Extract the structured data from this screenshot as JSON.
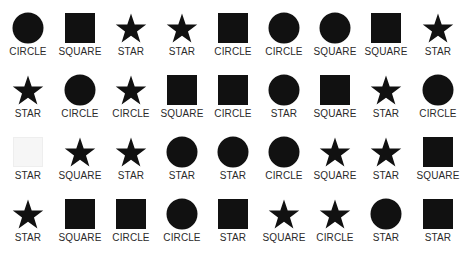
{
  "colors": {
    "fill": "#111111",
    "faint": "#f6f6f6",
    "faint_stroke": "#eeeeee",
    "label": "#2a2a2a"
  },
  "grid": {
    "rows": [
      [
        {
          "shape": "circle",
          "label": "CIRCLE"
        },
        {
          "shape": "square",
          "label": "SQUARE"
        },
        {
          "shape": "star",
          "label": "STAR"
        },
        {
          "shape": "star",
          "label": "STAR"
        },
        {
          "shape": "square",
          "label": "CIRCLE"
        },
        {
          "shape": "circle",
          "label": "CIRCLE"
        },
        {
          "shape": "circle",
          "label": "SQUARE"
        },
        {
          "shape": "square",
          "label": "SQUARE"
        },
        {
          "shape": "star",
          "label": "STAR"
        }
      ],
      [
        {
          "shape": "star",
          "label": "STAR"
        },
        {
          "shape": "circle",
          "label": "CIRCLE"
        },
        {
          "shape": "star",
          "label": "CIRCLE"
        },
        {
          "shape": "square",
          "label": "SQUARE"
        },
        {
          "shape": "square",
          "label": "CIRCLE"
        },
        {
          "shape": "circle",
          "label": "STAR"
        },
        {
          "shape": "square",
          "label": "SQUARE"
        },
        {
          "shape": "star",
          "label": "STAR"
        },
        {
          "shape": "circle",
          "label": "CIRCLE"
        }
      ],
      [
        {
          "shape": "square-faint",
          "label": "STAR"
        },
        {
          "shape": "star",
          "label": "SQUARE"
        },
        {
          "shape": "star",
          "label": "STAR"
        },
        {
          "shape": "circle",
          "label": "STAR"
        },
        {
          "shape": "circle",
          "label": "STAR"
        },
        {
          "shape": "circle",
          "label": "CIRCLE"
        },
        {
          "shape": "star",
          "label": "SQUARE"
        },
        {
          "shape": "star",
          "label": "STAR"
        },
        {
          "shape": "square",
          "label": "SQUARE"
        }
      ],
      [
        {
          "shape": "star",
          "label": "STAR"
        },
        {
          "shape": "square",
          "label": "SQUARE"
        },
        {
          "shape": "square",
          "label": "CIRCLE"
        },
        {
          "shape": "circle",
          "label": "CIRCLE"
        },
        {
          "shape": "square",
          "label": "STAR"
        },
        {
          "shape": "star",
          "label": "SQUARE"
        },
        {
          "shape": "star",
          "label": "CIRCLE"
        },
        {
          "shape": "circle",
          "label": "STAR"
        },
        {
          "shape": "square",
          "label": "STAR"
        }
      ]
    ]
  }
}
